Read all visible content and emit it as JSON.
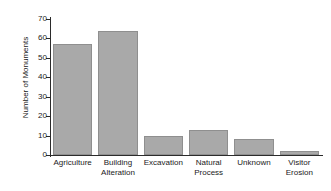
{
  "chart_data": {
    "type": "bar",
    "title": "",
    "xlabel": "",
    "ylabel": "Number of Monuments",
    "categories": [
      "Agriculture",
      "Building Alteration",
      "Excavation",
      "Natural Process",
      "Unknown",
      "Visitor Erosion"
    ],
    "category_lines": [
      [
        "Agriculture"
      ],
      [
        "Building",
        "Alteration"
      ],
      [
        "Excavation"
      ],
      [
        "Natural",
        "Process"
      ],
      [
        "Unknown"
      ],
      [
        "Visitor",
        "Erosion"
      ]
    ],
    "values": [
      57,
      64,
      10,
      13,
      8,
      2
    ],
    "ylim": [
      0,
      70
    ],
    "yticks": [
      0,
      10,
      20,
      30,
      40,
      50,
      60,
      70
    ],
    "ytick_labels": [
      "0",
      "10",
      "20",
      "30",
      "40",
      "50",
      "60",
      "70"
    ],
    "grid": false,
    "legend": null,
    "bar_color": "#a9a9a9",
    "bar_edge_color": "#8f8f8f",
    "axis_color": "#2b2b2b"
  }
}
